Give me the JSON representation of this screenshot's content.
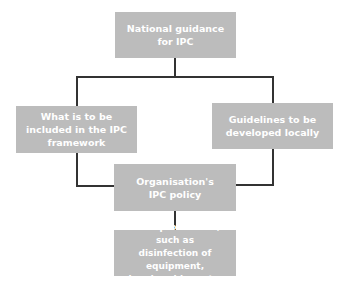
{
  "diagram": {
    "type": "flowchart",
    "colors": {
      "box_fill": "#bcbcbc",
      "box_text": "#ffffff",
      "connector": "#333333"
    },
    "nodes": {
      "national": {
        "label": "National guidance\nfor IPC"
      },
      "framework": {
        "label": "What is to be\nincluded in the IPC\nframework"
      },
      "guidelines": {
        "label": "Guidelines to be\ndeveloped locally"
      },
      "policy": {
        "label": "Organisation's\nIPC policy"
      },
      "procedures": {
        "label": "Local procedures, such as\ndisinfection of equipment,\nhandwashing, etc."
      }
    },
    "edges": [
      {
        "from": "national",
        "to": "framework"
      },
      {
        "from": "national",
        "to": "guidelines"
      },
      {
        "from": "framework",
        "to": "policy"
      },
      {
        "from": "guidelines",
        "to": "policy"
      },
      {
        "from": "policy",
        "to": "procedures"
      }
    ]
  }
}
